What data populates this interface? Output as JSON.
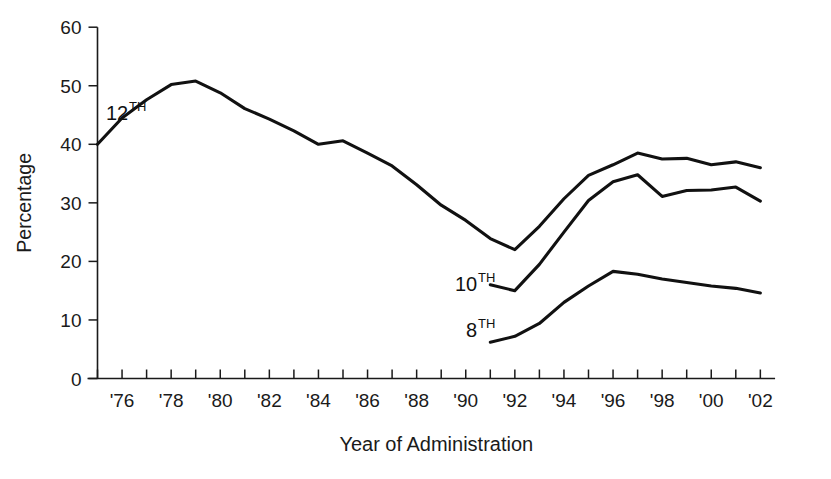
{
  "chart_data": {
    "type": "line",
    "title": "",
    "xlabel": "Year of Administration",
    "ylabel": "Percentage",
    "ylim": [
      0,
      60
    ],
    "yticks": [
      0,
      10,
      20,
      30,
      40,
      50,
      60
    ],
    "ytick_labels": [
      "0",
      "10",
      "20",
      "30",
      "40",
      "50",
      "60"
    ],
    "xlim": [
      1975,
      2002.6
    ],
    "xticks": [
      1976,
      1978,
      1980,
      1982,
      1984,
      1986,
      1988,
      1990,
      1992,
      1994,
      1996,
      1998,
      2000,
      2002
    ],
    "xtick_labels": [
      "'76",
      "'78",
      "'80",
      "'82",
      "'84",
      "'86",
      "'88",
      "'90",
      "'92",
      "'94",
      "'96",
      "'98",
      "'00",
      "'02"
    ],
    "minor_xticks": [
      1975,
      1977,
      1979,
      1981,
      1983,
      1985,
      1987,
      1989,
      1991,
      1993,
      1995,
      1997,
      1999,
      2001
    ],
    "grid": false,
    "legend_position": "inline-annotations",
    "series": [
      {
        "name": "12TH",
        "label_base": "12",
        "label_sup": "TH",
        "color": "#111111",
        "x": [
          1975,
          1976,
          1977,
          1978,
          1979,
          1980,
          1981,
          1982,
          1983,
          1984,
          1985,
          1986,
          1987,
          1988,
          1989,
          1990,
          1991,
          1992,
          1993,
          1994,
          1995,
          1996,
          1997,
          1998,
          1999,
          2000,
          2001,
          2002
        ],
        "values": [
          40.0,
          44.5,
          47.6,
          50.2,
          50.8,
          48.8,
          46.1,
          44.3,
          42.3,
          40.0,
          40.6,
          38.5,
          36.3,
          33.1,
          29.6,
          27.0,
          23.9,
          22.0,
          26.0,
          30.7,
          34.7,
          36.5,
          38.5,
          37.5,
          37.6,
          36.5,
          37.0,
          36.0
        ]
      },
      {
        "name": "10TH",
        "label_base": "10",
        "label_sup": "TH",
        "color": "#111111",
        "x": [
          1991,
          1992,
          1993,
          1994,
          1995,
          1996,
          1997,
          1998,
          1999,
          2000,
          2001,
          2002
        ],
        "values": [
          16.0,
          15.0,
          19.5,
          25.0,
          30.4,
          33.6,
          34.8,
          31.1,
          32.1,
          32.2,
          32.7,
          30.3
        ]
      },
      {
        "name": "8TH",
        "label_base": "8",
        "label_sup": "TH",
        "color": "#111111",
        "x": [
          1991,
          1992,
          1993,
          1994,
          1995,
          1996,
          1997,
          1998,
          1999,
          2000,
          2001,
          2002
        ],
        "values": [
          6.2,
          7.2,
          9.4,
          13.0,
          15.8,
          18.3,
          17.8,
          17.0,
          16.4,
          15.8,
          15.4,
          14.6
        ]
      }
    ],
    "annotations": [
      {
        "name": "series-label-12th",
        "text_base": "12",
        "text_sup": "TH",
        "x_px": 106,
        "y_px": 120
      },
      {
        "name": "series-label-10th",
        "text_base": "10",
        "text_sup": "TH",
        "x_px": 455,
        "y_px": 291
      },
      {
        "name": "series-label-8th",
        "text_base": "8",
        "text_sup": "TH",
        "x_px": 466,
        "y_px": 337
      }
    ]
  }
}
